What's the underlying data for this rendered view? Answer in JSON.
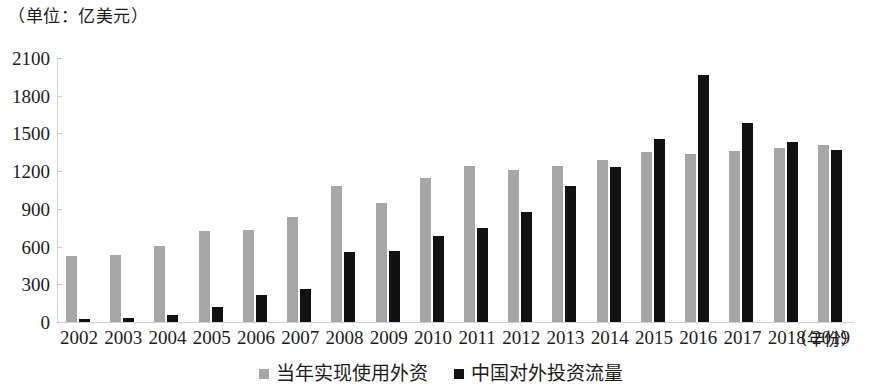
{
  "caption": {
    "unit": "（单位：亿美元）",
    "x_axis_title": "（年份）"
  },
  "chart_data": {
    "type": "bar",
    "title": "",
    "subtitle": "",
    "xlabel": "（年份）",
    "ylabel": "（单位：亿美元）",
    "unit": "亿美元",
    "categories": [
      "2002",
      "2003",
      "2004",
      "2005",
      "2006",
      "2007",
      "2008",
      "2009",
      "2010",
      "2011",
      "2012",
      "2013",
      "2014",
      "2015",
      "2016",
      "2017",
      "2018",
      "2019"
    ],
    "series": [
      {
        "name": "当年实现使用外资",
        "color": "#a6a6a6",
        "values": [
          527,
          535,
          606,
          724,
          730,
          835,
          1083,
          950,
          1147,
          1240,
          1211,
          1239,
          1285,
          1356,
          1337,
          1363,
          1383,
          1412
        ]
      },
      {
        "name": "中国对外投资流量",
        "color": "#111111",
        "values": [
          27,
          29,
          55,
          123,
          212,
          265,
          559,
          565,
          688,
          747,
          878,
          1078,
          1231,
          1456,
          1961,
          1583,
          1430,
          1369
        ]
      }
    ],
    "ylim": [
      0,
      2100
    ],
    "yticks": [
      0,
      300,
      600,
      900,
      1200,
      1500,
      1800,
      2100
    ],
    "ytick_labels": [
      "0",
      "300",
      "600",
      "900",
      "1200",
      "1500",
      "1800",
      "2100"
    ],
    "grid": false,
    "legend_position": "bottom-center"
  }
}
